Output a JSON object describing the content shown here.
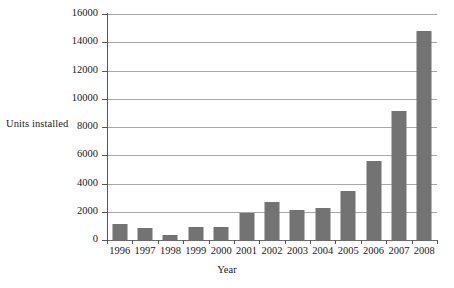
{
  "chart_data": {
    "type": "bar",
    "title": "",
    "xlabel": "Year",
    "ylabel": "Units installed",
    "categories": [
      "1996",
      "1997",
      "1998",
      "1999",
      "2000",
      "2001",
      "2002",
      "2003",
      "2004",
      "2005",
      "2006",
      "2007",
      "2008"
    ],
    "values": [
      1100,
      870,
      350,
      930,
      930,
      1920,
      2680,
      2090,
      2260,
      3470,
      5560,
      9150,
      14800
    ],
    "ylim": [
      0,
      16000
    ],
    "yticks": [
      0,
      2000,
      4000,
      6000,
      8000,
      10000,
      12000,
      14000,
      16000
    ],
    "ytick_labels": [
      "0",
      "2000",
      "4000",
      "6000",
      "8000",
      "10000",
      "12000",
      "14000",
      "16000"
    ],
    "grid": "horizontal",
    "legend": "none",
    "series": [
      {
        "name": "Units installed",
        "values": [
          1100,
          870,
          350,
          930,
          930,
          1920,
          2680,
          2090,
          2260,
          3470,
          5560,
          9150,
          14800
        ]
      }
    ],
    "colors": {
      "bar": "#737373",
      "gridline": "#a8a8a8",
      "axis": "#555555",
      "text": "#1a1a1a",
      "background": "#ffffff"
    }
  }
}
